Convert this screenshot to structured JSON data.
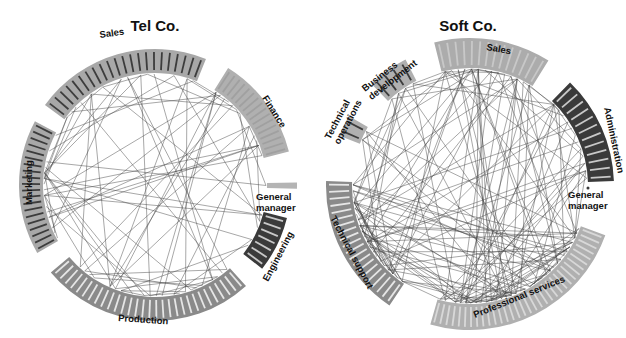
{
  "figure": {
    "panels": [
      {
        "id": "telco",
        "title": "Tel Co.",
        "center": [
          155,
          185
        ],
        "inner_radius": 112,
        "segments": [
          {
            "name": "Sales",
            "start_deg": 216,
            "end_deg": 292,
            "depth": 24,
            "members": 22,
            "fill": "#a8a8a8",
            "stripe": "#3c3c3c",
            "label_pos": [
              100,
              38
            ],
            "label_rot": -8
          },
          {
            "name": "Finance",
            "start_deg": 302,
            "end_deg": 346,
            "depth": 26,
            "members": 16,
            "fill": "#b0b0b0",
            "stripe": "#a0a0a0",
            "label_pos": [
              262,
              98
            ],
            "label_rot": 58
          },
          {
            "name": "General manager",
            "start_deg": -1,
            "end_deg": 1.5,
            "depth": 30,
            "members": 1,
            "fill": "#b4b4b4",
            "stripe": "#b4b4b4",
            "label_pos": [
              256,
              200
            ],
            "label_rot": 0
          },
          {
            "name": "Engineering",
            "start_deg": 14,
            "end_deg": 38,
            "depth": 24,
            "members": 7,
            "fill": "#3a3a3a",
            "stripe": "#c8c8c8",
            "label_pos": [
              268,
              282
            ],
            "label_rot": -62
          },
          {
            "name": "Production",
            "start_deg": 48,
            "end_deg": 140,
            "depth": 24,
            "members": 30,
            "fill": "#8a8a8a",
            "stripe": "#e6e6e6",
            "label_pos": [
              118,
              321
            ],
            "label_rot": 4
          },
          {
            "name": "Marketing",
            "start_deg": 150,
            "end_deg": 208,
            "depth": 24,
            "members": 20,
            "fill": "#a8a8a8",
            "stripe": "#3c3c3c",
            "label_pos": [
              32,
              205
            ],
            "label_rot": -90
          }
        ]
      },
      {
        "id": "softco",
        "title": "Soft Co.",
        "center": [
          470,
          186
        ],
        "inner_radius": 118,
        "segments": [
          {
            "name": "Technical operations",
            "start_deg": 201,
            "end_deg": 210,
            "depth": 22,
            "members": 2,
            "fill": "#b0b0b0",
            "stripe": "#3c3c3c",
            "label_pos": [
              330,
              140
            ],
            "label_rot": -62
          },
          {
            "name": "Business development",
            "start_deg": 226,
            "end_deg": 243,
            "depth": 24,
            "members": 4,
            "fill": "#b0b0b0",
            "stripe": "#3c3c3c",
            "label_pos": [
              365,
              92
            ],
            "label_rot": -38
          },
          {
            "name": "Sales",
            "start_deg": 256,
            "end_deg": 302,
            "depth": 30,
            "members": 14,
            "fill": "#acacac",
            "stripe": "#c8c8c8",
            "label_pos": [
              486,
              50
            ],
            "label_rot": 10
          },
          {
            "name": "Administration",
            "start_deg": 314,
            "end_deg": 358,
            "depth": 26,
            "members": 12,
            "fill": "#3a3a3a",
            "stripe": "#c8c8c8",
            "label_pos": [
              604,
              108
            ],
            "label_rot": 78
          },
          {
            "name": "General manager",
            "start_deg": 1,
            "end_deg": 3,
            "depth": 0,
            "members": 1,
            "fill": "#3a3a3a",
            "stripe": "#3a3a3a",
            "label_pos": [
              568,
              198
            ],
            "label_rot": 0
          },
          {
            "name": "Professional services",
            "start_deg": 20,
            "end_deg": 106,
            "depth": 26,
            "members": 34,
            "fill": "#b0b0b0",
            "stripe": "#d8d8d8",
            "label_pos": [
              475,
              318
            ],
            "label_rot": -22
          },
          {
            "name": "Technical support",
            "start_deg": 124,
            "end_deg": 182,
            "depth": 26,
            "members": 20,
            "fill": "#8a8a8a",
            "stripe": "#e6e6e6",
            "label_pos": [
              330,
              218
            ],
            "label_rot": 62
          }
        ]
      }
    ]
  }
}
